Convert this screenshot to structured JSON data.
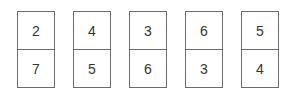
{
  "cards": [
    {
      "top": "2",
      "bottom": "7"
    },
    {
      "top": "4",
      "bottom": "5"
    },
    {
      "top": "3",
      "bottom": "6"
    },
    {
      "top": "6",
      "bottom": "3"
    },
    {
      "top": "5",
      "bottom": "4"
    }
  ]
}
